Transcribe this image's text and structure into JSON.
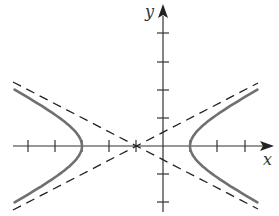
{
  "chart_data": {
    "type": "line",
    "title": "",
    "xlabel": "x",
    "ylabel": "y",
    "xlim": [
      -6,
      4
    ],
    "ylim": [
      -2.4,
      5
    ],
    "grid": false,
    "tick_labels_shown": false,
    "x_ticks": [
      -5,
      -4,
      -3,
      -2,
      -1,
      1,
      2,
      3
    ],
    "y_ticks": [
      -2,
      -1,
      1,
      2,
      3,
      4
    ],
    "series": [
      {
        "name": "hyperbola",
        "equation": "(x+1)^2/4 - y^2 = 1",
        "style": "solid",
        "color": "#707070",
        "center": [
          -1,
          0
        ],
        "vertices": [
          [
            -3,
            0
          ],
          [
            1,
            0
          ]
        ],
        "a": 2,
        "b": 1
      },
      {
        "name": "asymptote-1",
        "equation": "y = (x+1)/2",
        "style": "dashed",
        "color": "#222222"
      },
      {
        "name": "asymptote-2",
        "equation": "y = -(x+1)/2",
        "style": "dashed",
        "color": "#222222"
      }
    ]
  },
  "labels": {
    "x_axis": "x",
    "y_axis": "y"
  },
  "colors": {
    "axis": "#333333",
    "curve": "#707070",
    "asymptote": "#222222"
  }
}
